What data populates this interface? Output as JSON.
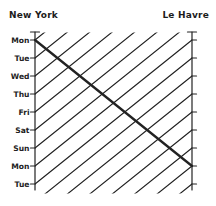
{
  "header": {
    "left_port": "New York",
    "right_port": "Le Havre"
  },
  "left_axis_days": [
    "Mon",
    "Tue",
    "Wed",
    "Thu",
    "Fri",
    "Sat",
    "Sun",
    "Mon",
    "Tue"
  ],
  "diagram": {
    "kind": "space-time ship schedule diagram",
    "eastbound_voyage": {
      "departs": "New York",
      "departure_day": "Mon",
      "arrives": "Le Havre",
      "arrival_day": "Mon",
      "duration_days": 7,
      "style": "thick"
    },
    "westbound_voyages": {
      "departs": "Le Havre",
      "arrives": "New York",
      "duration_days": 7,
      "interval_days": 1,
      "count": 16,
      "style": "thin"
    },
    "colors": {
      "ink": "#222222",
      "background": "#ffffff"
    }
  }
}
